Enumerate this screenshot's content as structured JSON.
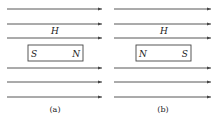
{
  "panels": [
    {
      "id": "a",
      "caption": "(a)",
      "field_label": "H",
      "magnet": {
        "left_pole": "S",
        "right_pole": "N"
      }
    },
    {
      "id": "b",
      "caption": "(b)",
      "field_label": "H",
      "magnet": {
        "left_pole": "N",
        "right_pole": "S"
      }
    }
  ],
  "colors": {
    "line": "#444444",
    "text": "#222222"
  }
}
